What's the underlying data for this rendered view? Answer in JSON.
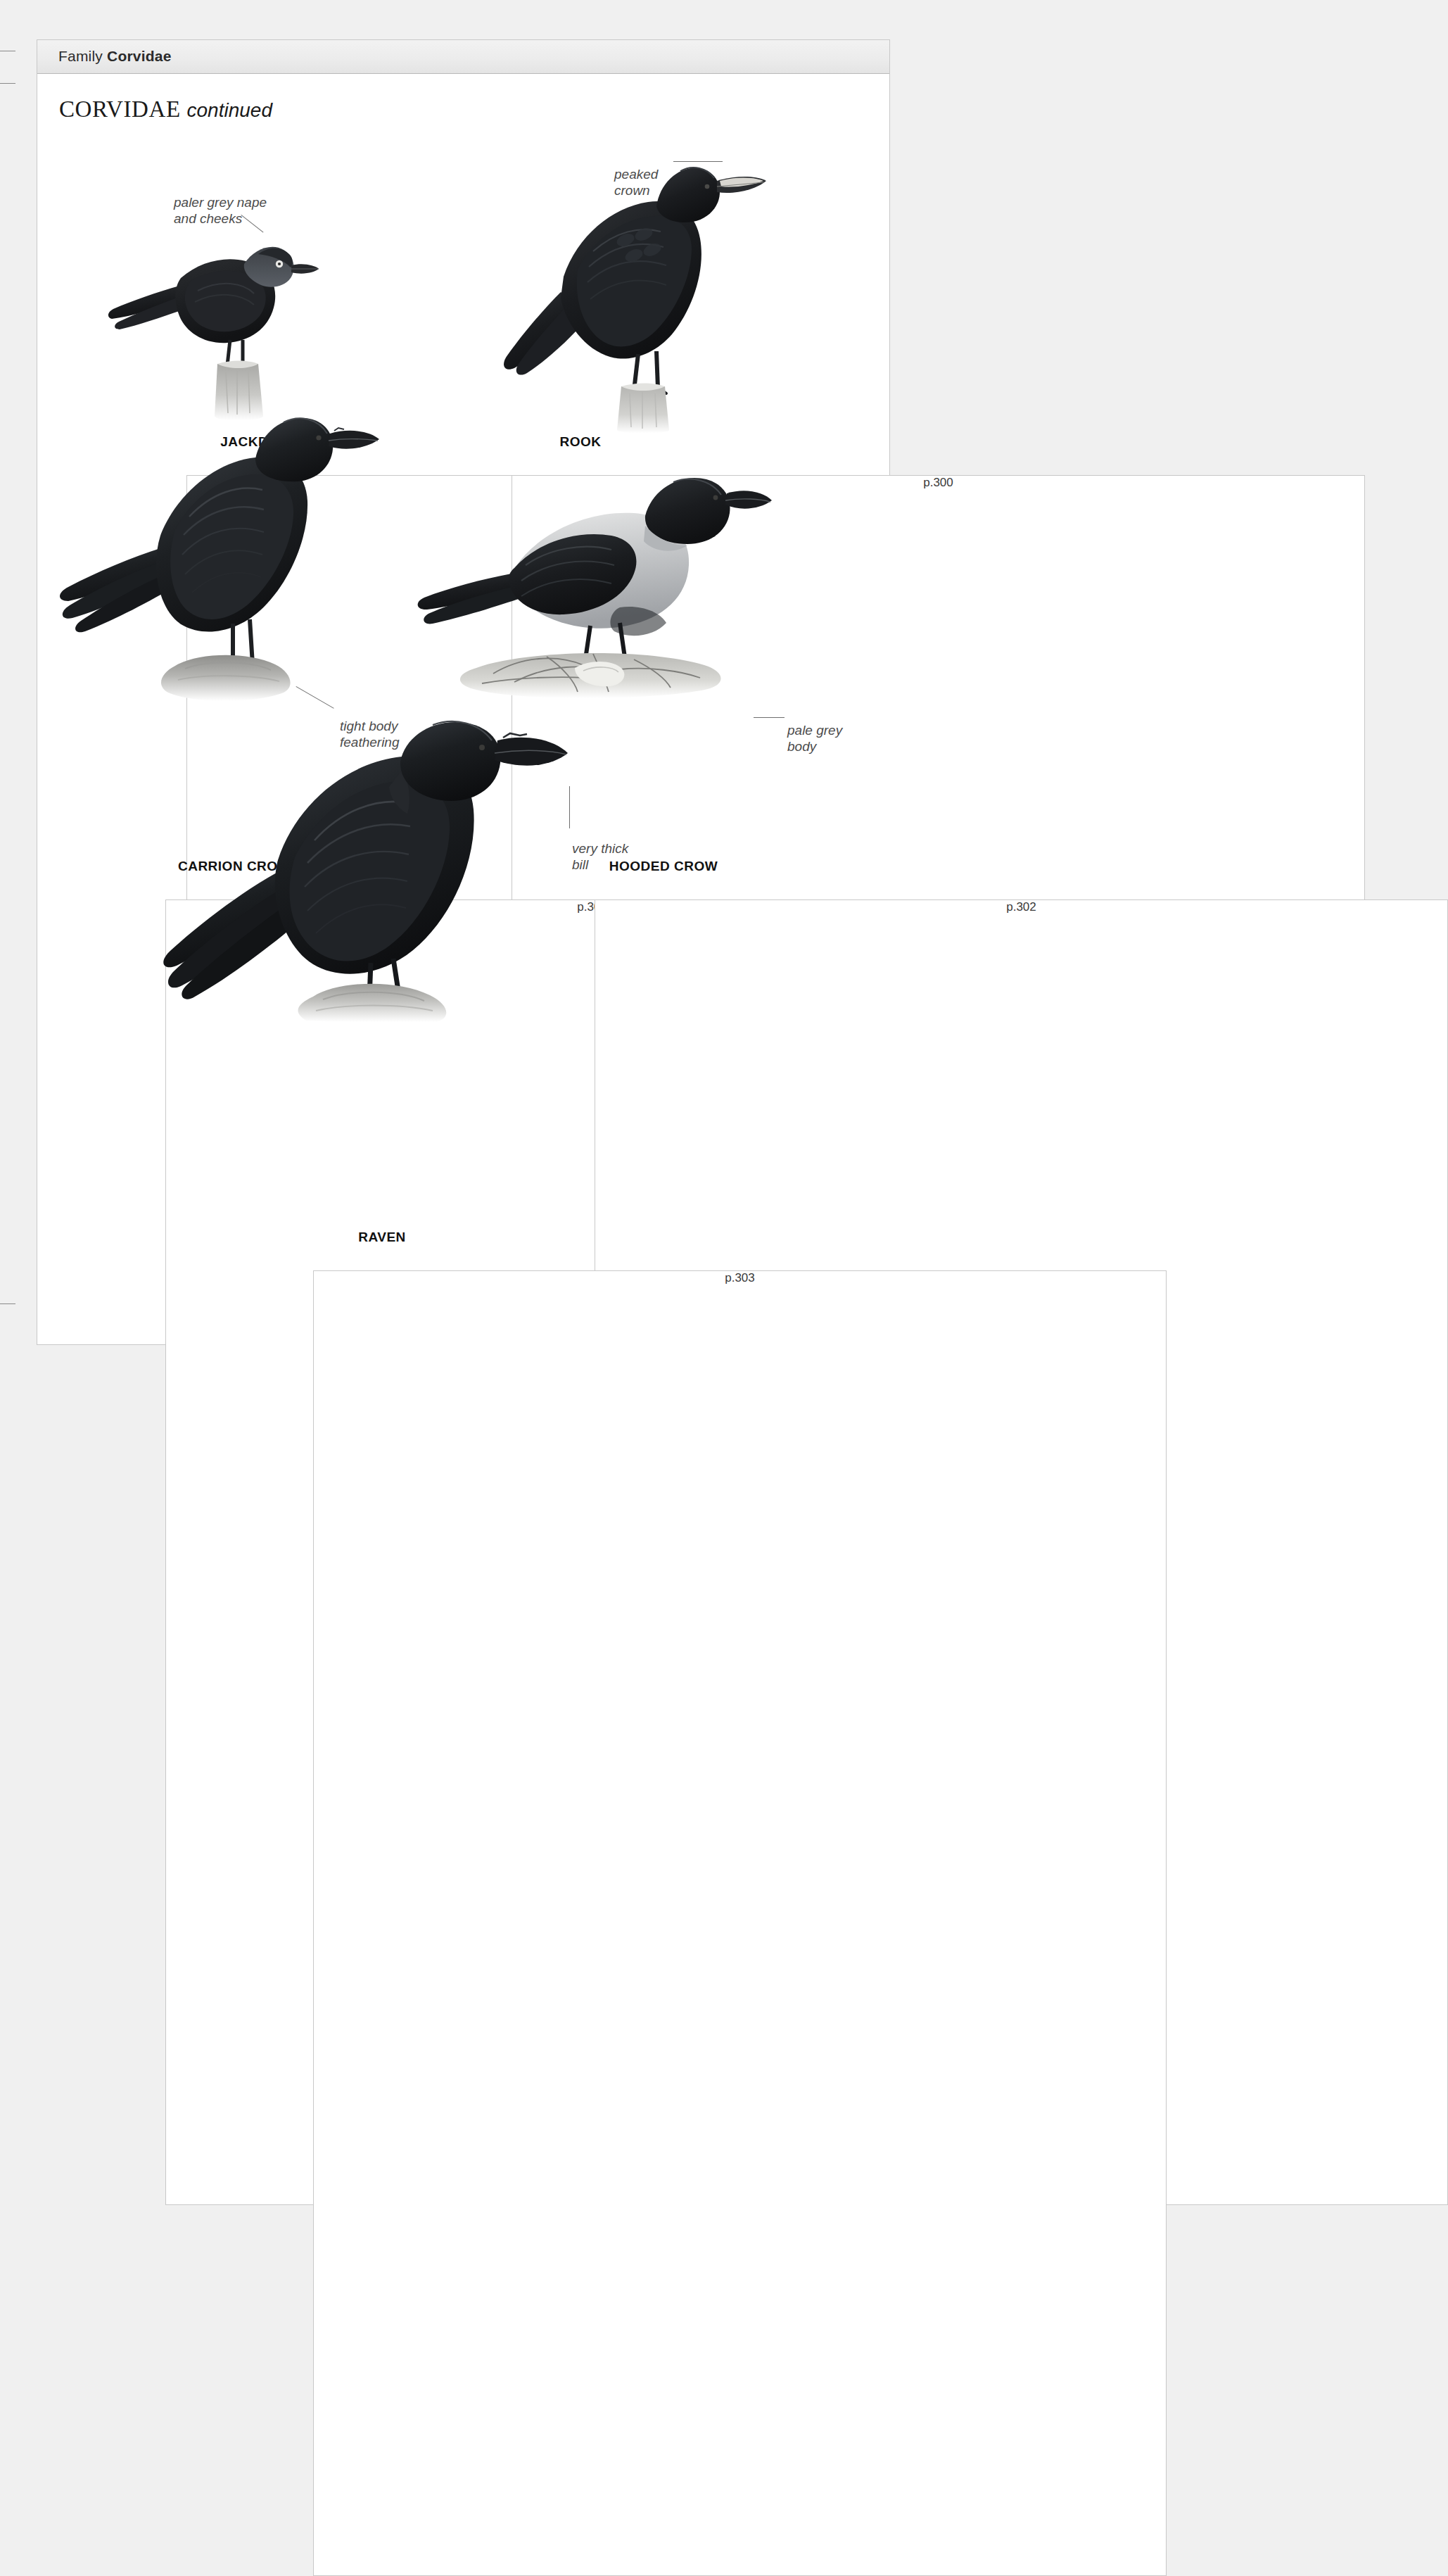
{
  "page": {
    "running_head": {
      "prefix": "Family",
      "family": "Corvidae"
    },
    "section_title": {
      "main": "CORVIDAE",
      "suffix": "continued"
    }
  },
  "species": [
    {
      "id": "jackdaw",
      "name": "JACKDAW",
      "page_ref": "p.299"
    },
    {
      "id": "rook",
      "name": "ROOK",
      "page_ref": "p.300"
    },
    {
      "id": "carrion-crow",
      "name": "CARRION CROW",
      "page_ref": "p.301"
    },
    {
      "id": "hooded-crow",
      "name": "HOODED CROW",
      "page_ref": "p.302"
    },
    {
      "id": "raven",
      "name": "RAVEN",
      "page_ref": "p.303"
    }
  ],
  "annotations": [
    {
      "id": "paler-grey-nape",
      "text": "paler grey nape\nand cheeks",
      "species": "jackdaw"
    },
    {
      "id": "peaked-crown",
      "text": "peaked\ncrown",
      "species": "rook"
    },
    {
      "id": "tight-body-feathering",
      "text": "tight body\nfeathering",
      "species": "carrion-crow"
    },
    {
      "id": "pale-grey-body",
      "text": "pale grey\nbody",
      "species": "hooded-crow"
    },
    {
      "id": "very-thick-bill",
      "text": "very thick\nbill",
      "species": "raven"
    }
  ],
  "colors": {
    "page_background": "#ffffff",
    "outer_background": "#f0f0f0",
    "header_bar": "#ececec",
    "rule": "#b9b9b9",
    "text": "#1a1a1a",
    "annotation_text": "#4c4c4c",
    "plumage_black": "#17181a",
    "plumage_grey": "#b9bcc0",
    "perch_grey": "#bfbfbd"
  }
}
